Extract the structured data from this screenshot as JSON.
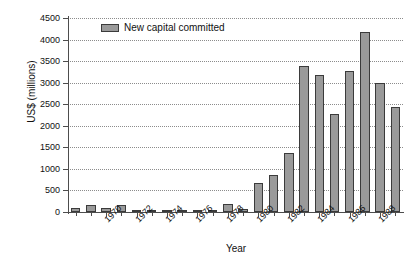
{
  "chart_data": {
    "type": "bar",
    "title": "",
    "xlabel": "Year",
    "ylabel": "US$ (millions)",
    "ylim": [
      0,
      4500
    ],
    "yticks": [
      0,
      500,
      1000,
      1500,
      2000,
      2500,
      3000,
      3500,
      4000,
      4500
    ],
    "ytick_labels": [
      "0",
      "500",
      "1000",
      "1500",
      "2000",
      "2500",
      "3000",
      "3500",
      "4000",
      "4500"
    ],
    "grid": true,
    "legend_position": "upper-left",
    "series": [
      {
        "name": "New capital committed",
        "color": "#9a9a9a",
        "edge_color": "#3b3b3b",
        "values": [
          100,
          160,
          95,
          155,
          35,
          35,
          55,
          20,
          50,
          15,
          175,
          60,
          680,
          870,
          1370,
          3380,
          3170,
          2270,
          3260,
          4170,
          2990,
          2430
        ]
      }
    ],
    "categories": [
      "1968",
      "1969",
      "1970",
      "1971",
      "1972",
      "1973",
      "1974",
      "1975",
      "1976",
      "1977",
      "1978",
      "1979",
      "1980",
      "1981",
      "1982",
      "1983",
      "1984",
      "1985",
      "1986",
      "1987",
      "1988",
      "1989"
    ],
    "xtick_labels": [
      "1970",
      "1972",
      "1974",
      "1976",
      "1978",
      "1980",
      "1982",
      "1984",
      "1986",
      "1988"
    ],
    "xtick_categories": [
      "1970",
      "1972",
      "1974",
      "1976",
      "1978",
      "1980",
      "1982",
      "1984",
      "1986",
      "1988"
    ]
  }
}
